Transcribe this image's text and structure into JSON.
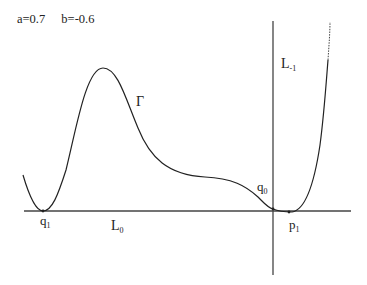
{
  "header": {
    "param_a": "a=0.7",
    "param_b": "b=-0.6"
  },
  "labels": {
    "gamma": "Γ",
    "L_minus1": {
      "main": "L",
      "sub": "-1"
    },
    "L_0": {
      "main": "L",
      "sub": "0"
    },
    "q_1": {
      "main": "q",
      "sub": "1"
    },
    "q_0": {
      "main": "q",
      "sub": "0"
    },
    "p_1": {
      "main": "p",
      "sub": "1"
    }
  },
  "colors": {
    "line": "#333333",
    "curve": "#222222",
    "background": "#ffffff"
  }
}
